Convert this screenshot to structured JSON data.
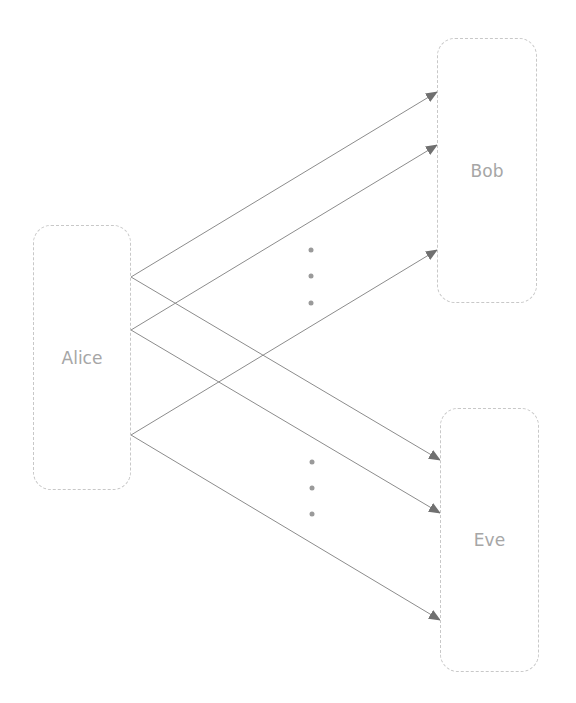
{
  "nodes": {
    "alice": {
      "label": "Alice",
      "x": 33,
      "y": 225,
      "w": 98,
      "h": 265
    },
    "bob": {
      "label": "Bob",
      "x": 437,
      "y": 38,
      "w": 100,
      "h": 265
    },
    "eve": {
      "label": "Eve",
      "x": 440,
      "y": 408,
      "w": 99,
      "h": 264
    }
  },
  "edges": [
    {
      "from": "alice",
      "to": "bob",
      "x1": 131,
      "y1": 277,
      "x2": 437,
      "y2": 92
    },
    {
      "from": "alice",
      "to": "bob",
      "x1": 131,
      "y1": 330,
      "x2": 437,
      "y2": 145
    },
    {
      "from": "alice",
      "to": "bob",
      "x1": 131,
      "y1": 435,
      "x2": 437,
      "y2": 250
    },
    {
      "from": "alice",
      "to": "eve",
      "x1": 131,
      "y1": 277,
      "x2": 440,
      "y2": 460
    },
    {
      "from": "alice",
      "to": "eve",
      "x1": 131,
      "y1": 330,
      "x2": 440,
      "y2": 513
    },
    {
      "from": "alice",
      "to": "eve",
      "x1": 131,
      "y1": 435,
      "x2": 440,
      "y2": 620
    }
  ],
  "ellipses": [
    {
      "name": "upper-ellipsis",
      "dots": [
        [
          311,
          250
        ],
        [
          311,
          276
        ],
        [
          311,
          303
        ]
      ]
    },
    {
      "name": "lower-ellipsis",
      "dots": [
        [
          312,
          462
        ],
        [
          312,
          488
        ],
        [
          312,
          514
        ]
      ]
    }
  ],
  "colors": {
    "edge": "#8c8c8c",
    "arrowhead": "#707070",
    "dot": "#9a9a9a",
    "node_border": "#c8c8c8",
    "label": "#a6a6a6"
  }
}
